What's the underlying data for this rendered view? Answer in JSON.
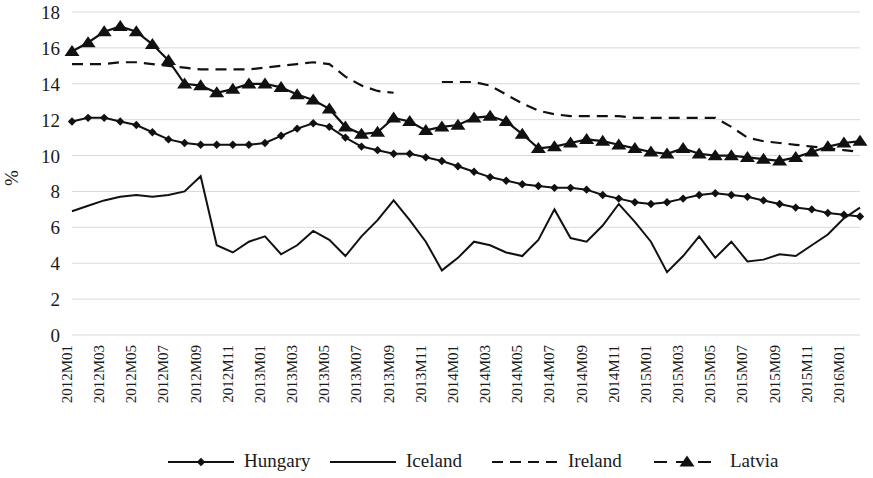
{
  "chart_data": {
    "type": "line",
    "title": "",
    "xlabel": "",
    "ylabel": "%",
    "ylim": [
      0,
      18
    ],
    "ytick_step": 2,
    "yticks": [
      0,
      2,
      4,
      6,
      8,
      10,
      12,
      14,
      16,
      18
    ],
    "grid": true,
    "legend_position": "bottom",
    "x": [
      "2012M01",
      "2012M02",
      "2012M03",
      "2012M04",
      "2012M05",
      "2012M06",
      "2012M07",
      "2012M08",
      "2012M09",
      "2012M10",
      "2012M11",
      "2012M12",
      "2013M01",
      "2013M02",
      "2013M03",
      "2013M04",
      "2013M05",
      "2013M06",
      "2013M07",
      "2013M08",
      "2013M09",
      "2013M10",
      "2013M11",
      "2013M12",
      "2014M01",
      "2014M02",
      "2014M03",
      "2014M04",
      "2014M05",
      "2014M06",
      "2014M07",
      "2014M08",
      "2014M09",
      "2014M10",
      "2014M11",
      "2014M12",
      "2015M01",
      "2015M02",
      "2015M03",
      "2015M04",
      "2015M05",
      "2015M06",
      "2015M07",
      "2015M08",
      "2015M09",
      "2015M10",
      "2015M11",
      "2015M12",
      "2016M01",
      "2016M02"
    ],
    "xtick_labels": [
      "2012M01",
      "2012M03",
      "2012M05",
      "2012M07",
      "2012M09",
      "2012M11",
      "2013M01",
      "2013M03",
      "2013M05",
      "2013M07",
      "2013M09",
      "2013M11",
      "2014M01",
      "2014M03",
      "2014M05",
      "2014M07",
      "2014M09",
      "2014M11",
      "2015M01",
      "2015M03",
      "2015M05",
      "2015M07",
      "2015M09",
      "2015M11",
      "2016M01"
    ],
    "xtick_every": 2,
    "series": [
      {
        "name": "Hungary",
        "style": "solid",
        "marker": "diamond",
        "color": "#111111",
        "values": [
          11.9,
          12.1,
          12.1,
          11.9,
          11.7,
          11.3,
          10.9,
          10.7,
          10.6,
          10.6,
          10.6,
          10.6,
          10.7,
          11.1,
          11.5,
          11.8,
          11.6,
          11.0,
          10.5,
          10.3,
          10.1,
          10.1,
          9.9,
          9.7,
          9.4,
          9.1,
          8.8,
          8.6,
          8.4,
          8.3,
          8.2,
          8.2,
          8.1,
          7.8,
          7.6,
          7.4,
          7.3,
          7.4,
          7.6,
          7.8,
          7.9,
          7.8,
          7.7,
          7.5,
          7.3,
          7.1,
          7.0,
          6.8,
          6.7,
          6.6
        ]
      },
      {
        "name": "Iceland",
        "style": "solid",
        "marker": "none",
        "color": "#111111",
        "values": [
          6.9,
          7.2,
          7.5,
          7.7,
          7.8,
          7.7,
          7.8,
          8.0,
          8.85,
          5.0,
          4.6,
          5.2,
          5.5,
          4.5,
          5.0,
          5.8,
          5.3,
          4.4,
          5.5,
          6.4,
          7.5,
          6.4,
          5.2,
          3.6,
          4.3,
          5.2,
          5.0,
          4.6,
          4.4,
          5.3,
          7.0,
          5.4,
          5.2,
          6.1,
          7.3,
          6.3,
          5.2,
          3.5,
          4.4,
          5.5,
          4.3,
          5.2,
          4.1,
          4.2,
          4.5,
          4.4,
          5.0,
          5.6,
          6.5,
          7.1
        ]
      },
      {
        "name": "Ireland",
        "style": "dashed",
        "marker": "none",
        "color": "#111111",
        "values": [
          15.1,
          15.1,
          15.1,
          15.2,
          15.2,
          15.1,
          15.0,
          14.9,
          14.8,
          14.8,
          14.8,
          14.8,
          14.9,
          15.0,
          15.1,
          15.2,
          15.1,
          14.4,
          13.9,
          13.6,
          13.5,
          13.8,
          14.0,
          14.1,
          14.1,
          14.1,
          13.9,
          13.4,
          12.9,
          12.5,
          12.3,
          12.2,
          12.2,
          12.2,
          12.2,
          12.1,
          12.1,
          12.1,
          12.1,
          12.1,
          12.1,
          11.6,
          11.0,
          10.8,
          10.7,
          10.6,
          10.5,
          10.4,
          10.3,
          10.2
        ]
      },
      {
        "name": "Latvia",
        "style": "dashed",
        "marker": "triangle",
        "color": "#111111",
        "values": [
          15.8,
          16.3,
          16.9,
          17.2,
          16.9,
          16.2,
          15.3,
          14.0,
          13.9,
          13.5,
          13.7,
          14.0,
          14.0,
          13.8,
          13.4,
          13.1,
          12.6,
          11.6,
          11.2,
          11.3,
          12.1,
          11.9,
          11.4,
          11.6,
          11.7,
          12.1,
          12.2,
          11.9,
          11.2,
          10.4,
          10.5,
          10.7,
          10.9,
          10.8,
          10.6,
          10.4,
          10.2,
          10.1,
          10.4,
          10.1,
          10.0,
          10.0,
          9.9,
          9.8,
          9.7,
          9.9,
          10.2,
          10.5,
          10.7,
          10.8
        ]
      }
    ],
    "series_segments": {
      "Iceland_upper_note": "Iceland-style upper solid trace",
      "note": "Ireland dashed upper trace has a break between 2013M10 and 2013M12; Ireland lower solid trace resumes near 2015M08"
    },
    "legend": [
      {
        "label": "Hungary",
        "style": "solid",
        "marker": "diamond"
      },
      {
        "label": "Iceland",
        "style": "solid",
        "marker": "none"
      },
      {
        "label": "Ireland",
        "style": "dashed",
        "marker": "none"
      },
      {
        "label": "Latvia",
        "style": "dashed",
        "marker": "triangle"
      }
    ]
  },
  "axis": {
    "y_label": "%",
    "y_ticks": [
      "0",
      "2",
      "4",
      "6",
      "8",
      "10",
      "12",
      "14",
      "16",
      "18"
    ]
  }
}
